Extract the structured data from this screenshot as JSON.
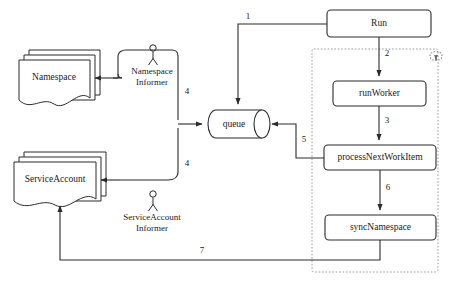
{
  "diagram": {
    "colors": {
      "stroke": "#2b2b2b",
      "fill": "#ffffff",
      "dashed_border": "#9a9a9a",
      "text": "#1a1a1a"
    },
    "stores": [
      {
        "id": "namespace-store",
        "label": "Namespace",
        "shape": "stacked-document"
      },
      {
        "id": "serviceaccount-store",
        "label": "ServiceAccount",
        "shape": "stacked-document"
      }
    ],
    "informers": [
      {
        "id": "namespace-informer",
        "label_line1": "Namespace",
        "label_line2": "Informer",
        "shape": "actor-bracket"
      },
      {
        "id": "serviceaccount-informer",
        "label_line1": "ServiceAccount",
        "label_line2": "Informer",
        "shape": "actor-bracket"
      }
    ],
    "queue": {
      "id": "queue",
      "label": "queue",
      "shape": "cylinder"
    },
    "process_group": {
      "id": "run-loop-group",
      "shape": "dashed-rectangle",
      "loop_icon": "loop-arrow-icon"
    },
    "nodes": [
      {
        "id": "run",
        "label": "Run",
        "shape": "rounded-rect"
      },
      {
        "id": "runworker",
        "label": "runWorker",
        "shape": "rounded-rect"
      },
      {
        "id": "processnextworkitem",
        "label": "processNextWorkItem",
        "shape": "rounded-rect"
      },
      {
        "id": "syncnamespace",
        "label": "syncNamespace",
        "shape": "rounded-rect"
      }
    ],
    "edges": [
      {
        "id": "edge-1",
        "label": "1",
        "from": "run",
        "to": "queue"
      },
      {
        "id": "edge-2",
        "label": "2",
        "from": "run",
        "to": "runworker"
      },
      {
        "id": "edge-3",
        "label": "3",
        "from": "runworker",
        "to": "processnextworkitem"
      },
      {
        "id": "edge-4-namespace",
        "label": "4",
        "from": "namespace-informer",
        "to": "queue"
      },
      {
        "id": "edge-4-serviceaccount",
        "label": "4",
        "from": "serviceaccount-informer",
        "to": "queue"
      },
      {
        "id": "edge-5",
        "label": "5",
        "from": "processnextworkitem",
        "to": "queue"
      },
      {
        "id": "edge-6",
        "label": "6",
        "from": "processnextworkitem",
        "to": "syncnamespace"
      },
      {
        "id": "edge-7",
        "label": "7",
        "from": "syncnamespace",
        "to": "serviceaccount-store"
      }
    ]
  }
}
